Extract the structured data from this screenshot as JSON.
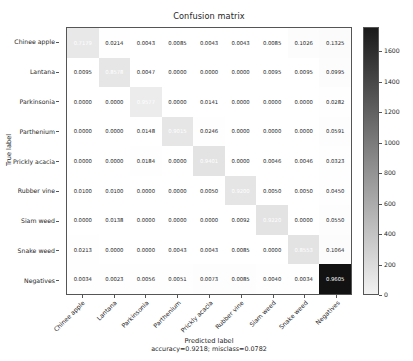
{
  "chart_data": {
    "type": "heatmap",
    "title": "Confusion matrix",
    "xlabel": "Predicted label",
    "xlabel_sub": "accuracy=0.9218; misclass=0.0782",
    "ylabel": "True label",
    "categories": [
      "Chinee apple",
      "Lantana",
      "Parkinsonia",
      "Parthenium",
      "Prickly acacia",
      "Rubber vine",
      "Siam weed",
      "Snake weed",
      "Negatives"
    ],
    "row_labels": [
      "Chinee apple",
      "Lantana",
      "Parkinsonia",
      "Parthenium",
      "Prickly acacia",
      "Rubber vine",
      "Siam weed",
      "Snake weed",
      "Negatives"
    ],
    "col_labels": [
      "Chinee apple",
      "Lantana",
      "Parkinsonia",
      "Parthenium",
      "Prickly acacia",
      "Rubber vine",
      "Siam weed",
      "Snake weed",
      "Negatives"
    ],
    "values": [
      [
        "0.7179",
        "0.0214",
        "0.0043",
        "0.0085",
        "0.0043",
        "0.0043",
        "0.0085",
        "0.1026",
        "0.1325"
      ],
      [
        "0.0095",
        "0.8578",
        "0.0047",
        "0.0000",
        "0.0000",
        "0.0000",
        "0.0095",
        "0.0095",
        "0.0995"
      ],
      [
        "0.0000",
        "0.0000",
        "0.9577",
        "0.0000",
        "0.0141",
        "0.0000",
        "0.0000",
        "0.0000",
        "0.0282"
      ],
      [
        "0.0000",
        "0.0000",
        "0.0148",
        "0.9015",
        "0.0246",
        "0.0000",
        "0.0000",
        "0.0000",
        "0.0591"
      ],
      [
        "0.0000",
        "0.0000",
        "0.0184",
        "0.0000",
        "0.9401",
        "0.0000",
        "0.0046",
        "0.0046",
        "0.0323"
      ],
      [
        "0.0100",
        "0.0100",
        "0.0000",
        "0.0000",
        "0.0050",
        "0.9200",
        "0.0050",
        "0.0050",
        "0.0450"
      ],
      [
        "0.0000",
        "0.0138",
        "0.0000",
        "0.0000",
        "0.0000",
        "0.0092",
        "0.9220",
        "0.0000",
        "0.0550"
      ],
      [
        "0.0213",
        "0.0000",
        "0.0000",
        "0.0043",
        "0.0043",
        "0.0085",
        "0.0000",
        "0.8553",
        "0.1064"
      ],
      [
        "0.0034",
        "0.0023",
        "0.0056",
        "0.0051",
        "0.0073",
        "0.0085",
        "0.0040",
        "0.0034",
        "0.9605"
      ]
    ],
    "counts": [
      [
        168,
        5,
        1,
        2,
        1,
        1,
        2,
        24,
        31
      ],
      [
        2,
        181,
        1,
        0,
        0,
        0,
        2,
        2,
        21
      ],
      [
        0,
        0,
        136,
        0,
        2,
        0,
        0,
        0,
        4
      ],
      [
        0,
        0,
        3,
        183,
        5,
        0,
        0,
        0,
        12
      ],
      [
        0,
        0,
        4,
        0,
        204,
        0,
        1,
        1,
        7
      ],
      [
        2,
        2,
        0,
        0,
        1,
        184,
        1,
        1,
        9
      ],
      [
        0,
        3,
        0,
        0,
        0,
        2,
        201,
        0,
        12
      ],
      [
        5,
        0,
        0,
        1,
        1,
        2,
        0,
        201,
        25
      ],
      [
        6,
        4,
        10,
        9,
        13,
        15,
        7,
        6,
        1700
      ]
    ],
    "diagonal_highlight": true,
    "colormap": "binary_r_gray",
    "colorbar": {
      "ticks": [
        "0",
        "200",
        "400",
        "600",
        "800",
        "1000",
        "1200",
        "1400",
        "1600"
      ],
      "tick_values": [
        0,
        200,
        400,
        600,
        800,
        1000,
        1200,
        1400,
        1600
      ],
      "min": 0,
      "max": 1760,
      "position": "right",
      "orientation": "vertical",
      "dark_is_high": true
    },
    "grid": false,
    "accuracy": "0.9218",
    "misclass": "0.0782",
    "text_color_low": "#262626",
    "text_color_high": "#ffffff",
    "cell_color_low": "#ffffff",
    "cell_color_high": "#1a1a1a",
    "axis_color": "#555555"
  }
}
